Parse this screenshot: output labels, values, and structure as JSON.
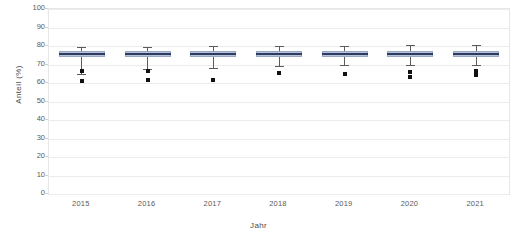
{
  "chart_data": {
    "type": "box",
    "title": "",
    "xlabel": "Jahr",
    "ylabel": "Anteil (%)",
    "ylim": [
      0,
      100
    ],
    "yticks": [
      0,
      10,
      20,
      30,
      40,
      50,
      60,
      70,
      80,
      90,
      100
    ],
    "ytick_labels": [
      "0",
      "10",
      "20",
      "30",
      "40",
      "50",
      "60",
      "70",
      "80",
      "90",
      "100"
    ],
    "categories": [
      "2015",
      "2016",
      "2017",
      "2018",
      "2019",
      "2020",
      "2021"
    ],
    "grid": true,
    "legend": "none",
    "colors": {
      "box_fill": "#b9c3d6",
      "box_edge": "#9aa7c0",
      "median": "#2b3b63",
      "whisker": "#5b5b5b",
      "outlier": "#111111",
      "gridline": "#ececec",
      "frame": "#e6e6e6",
      "text": "#5a5a5a"
    },
    "boxes": [
      {
        "category": "2015",
        "whisker_low": 65.0,
        "q1": 73.8,
        "median": 75.5,
        "q3": 77.3,
        "whisker_high": 79.3,
        "outliers": [
          66.5,
          61.0
        ]
      },
      {
        "category": "2016",
        "whisker_low": 67.5,
        "q1": 74.0,
        "median": 75.7,
        "q3": 77.4,
        "whisker_high": 79.6,
        "outliers": [
          66.4,
          61.4
        ]
      },
      {
        "category": "2017",
        "whisker_low": 68.2,
        "q1": 74.1,
        "median": 75.8,
        "q3": 77.5,
        "whisker_high": 79.8,
        "outliers": [
          61.8
        ]
      },
      {
        "category": "2018",
        "whisker_low": 69.3,
        "q1": 74.2,
        "median": 75.9,
        "q3": 77.5,
        "whisker_high": 80.0,
        "outliers": [
          65.5
        ]
      },
      {
        "category": "2019",
        "whisker_low": 69.5,
        "q1": 74.2,
        "median": 75.9,
        "q3": 77.4,
        "whisker_high": 80.2,
        "outliers": [
          64.6
        ]
      },
      {
        "category": "2020",
        "whisker_low": 69.8,
        "q1": 74.1,
        "median": 75.8,
        "q3": 77.3,
        "whisker_high": 80.4,
        "outliers": [
          66.0,
          63.2
        ]
      },
      {
        "category": "2021",
        "whisker_low": 69.6,
        "q1": 74.0,
        "median": 75.7,
        "q3": 77.2,
        "whisker_high": 80.6,
        "outliers": [
          66.3,
          64.5
        ]
      }
    ]
  }
}
